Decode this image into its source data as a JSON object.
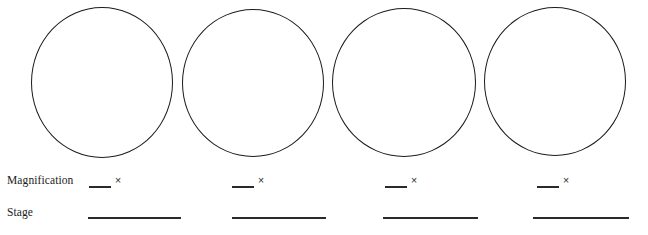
{
  "worksheet": {
    "rows": {
      "magnification_label": "Magnification",
      "stage_label": "Stage"
    },
    "times_symbol": "×",
    "panels": [
      {
        "index": "1",
        "magnification_value": "",
        "stage_value": ""
      },
      {
        "index": "2",
        "magnification_value": "",
        "stage_value": ""
      },
      {
        "index": "3",
        "magnification_value": "",
        "stage_value": ""
      },
      {
        "index": "4",
        "magnification_value": "",
        "stage_value": ""
      }
    ],
    "colors": {
      "page_background": "#ffffff",
      "ink": "#1b1b1b",
      "rule": "#2a2a2a"
    }
  }
}
